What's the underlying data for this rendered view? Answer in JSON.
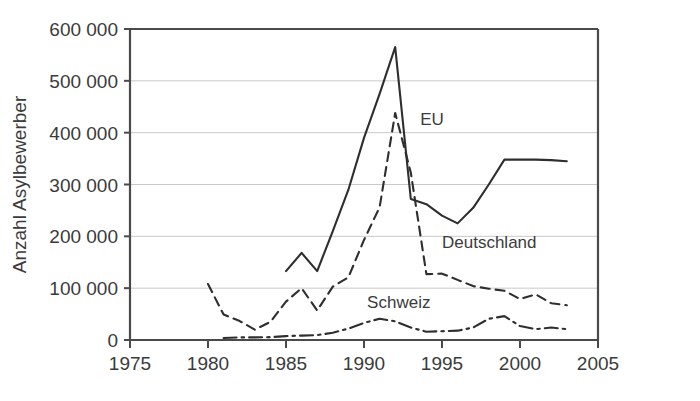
{
  "chart_data": {
    "type": "line",
    "title": "",
    "subtitle": "",
    "xlabel": "",
    "ylabel": "Anzahl Asylbewerber",
    "xlim": [
      1975,
      2005
    ],
    "ylim": [
      0,
      600000
    ],
    "xticks": [
      1975,
      1980,
      1985,
      1990,
      1995,
      2000,
      2005
    ],
    "xtick_labels": [
      "1975",
      "1980",
      "1985",
      "1990",
      "1995",
      "2000",
      "2005"
    ],
    "yticks": [
      0,
      100000,
      200000,
      300000,
      400000,
      500000,
      600000
    ],
    "ytick_labels": [
      "0",
      "100 000",
      "200 000",
      "300 000",
      "400 000",
      "500 000",
      "600 000"
    ],
    "grid": true,
    "grid_axis": "y",
    "legend_position": "inline-annotations",
    "series": [
      {
        "name": "EU",
        "label": "EU",
        "style": "solid",
        "color": "#2e2e2e",
        "label_x": 1993.6,
        "label_y": 415000,
        "x": [
          1985,
          1986,
          1987,
          1988,
          1989,
          1990,
          1991,
          1992,
          1993,
          1994,
          1995,
          1996,
          1997,
          1998,
          1999,
          2000,
          2001,
          2002,
          2003
        ],
        "values": [
          133000,
          168000,
          133000,
          210000,
          290000,
          390000,
          475000,
          565000,
          272000,
          262000,
          240000,
          225000,
          255000,
          300000,
          348000,
          348000,
          348000,
          347000,
          345000
        ]
      },
      {
        "name": "Deutschland",
        "label": "Deutschland",
        "style": "dashed",
        "color": "#2e2e2e",
        "label_x": 1995.0,
        "label_y": 178000,
        "x": [
          1980,
          1981,
          1982,
          1983,
          1984,
          1985,
          1986,
          1987,
          1988,
          1989,
          1990,
          1991,
          1992,
          1993,
          1994,
          1995,
          1996,
          1997,
          1998,
          1999,
          2000,
          2001,
          2002,
          2003
        ],
        "values": [
          108000,
          49000,
          37000,
          20000,
          35000,
          74000,
          100000,
          57000,
          103000,
          121000,
          193000,
          256000,
          438000,
          323000,
          127000,
          128000,
          116000,
          104000,
          99000,
          95000,
          79000,
          88000,
          71000,
          67000
        ]
      },
      {
        "name": "Schweiz",
        "label": "Schweiz",
        "style": "dashdot",
        "color": "#2e2e2e",
        "label_x": 1990.2,
        "label_y": 62000,
        "x": [
          1981,
          1982,
          1983,
          1984,
          1985,
          1986,
          1987,
          1988,
          1989,
          1990,
          1991,
          1992,
          1993,
          1994,
          1995,
          1996,
          1997,
          1998,
          1999,
          2000,
          2001,
          2002,
          2003
        ],
        "values": [
          4000,
          5000,
          5000,
          5500,
          7500,
          8500,
          9500,
          14000,
          22000,
          33000,
          41000,
          36000,
          24000,
          16000,
          17000,
          18000,
          24000,
          41000,
          46000,
          27000,
          21000,
          24000,
          21000
        ]
      }
    ]
  },
  "geometry": {
    "plot_left": 130,
    "plot_right": 598,
    "plot_top": 29,
    "plot_bottom": 340
  }
}
